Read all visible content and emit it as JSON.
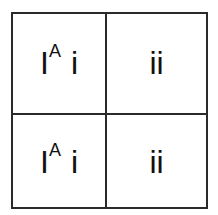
{
  "punnett_square": {
    "rows": [
      [
        {
          "base": "I",
          "sup": "A",
          "second": "i"
        },
        {
          "text": "ii"
        }
      ],
      [
        {
          "base": "I",
          "sup": "A",
          "second": "i"
        },
        {
          "text": "ii"
        }
      ]
    ],
    "line_color": "#2a2a2a"
  }
}
